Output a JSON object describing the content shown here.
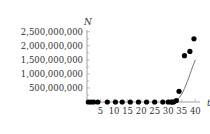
{
  "chart_data": {
    "type": "scatter",
    "title": "",
    "xlabel": "t",
    "ylabel": "N",
    "xlim": [
      0,
      41
    ],
    "ylim": [
      0,
      2600000000
    ],
    "grid": false,
    "legend": "none",
    "x_ticks": [
      5,
      10,
      15,
      20,
      25,
      30,
      35,
      40
    ],
    "x_tick_labels": [
      "5",
      "10",
      "15",
      "20",
      "25",
      "30",
      "35",
      "40"
    ],
    "y_ticks": [
      500000000,
      1000000000,
      1500000000,
      2000000000,
      2500000000
    ],
    "y_tick_labels": [
      "500,000,000",
      "1,000,000,000",
      "1,500,000,000",
      "2,000,000,000",
      "2,500,000,000"
    ],
    "series": [
      {
        "name": "observed",
        "kind": "points",
        "color": "#000000",
        "x": [
          0.5,
          1.5,
          2.5,
          4,
          7.5,
          10.5,
          13,
          16,
          19,
          22,
          25,
          28,
          30,
          31,
          31.5,
          32,
          33,
          34,
          36,
          38,
          39.5
        ],
        "y": [
          0,
          0,
          0,
          0,
          0,
          0,
          0,
          0,
          0,
          0,
          0,
          0,
          0,
          0,
          0,
          0,
          50000000,
          380000000,
          1650000000,
          1800000000,
          2250000000
        ]
      },
      {
        "name": "model",
        "kind": "line",
        "color": "#777777",
        "x": [
          30,
          31,
          32,
          33,
          34,
          35,
          36,
          37,
          38,
          39,
          40
        ],
        "y": [
          0,
          5000000,
          20000000,
          60000000,
          140000000,
          280000000,
          480000000,
          720000000,
          980000000,
          1250000000,
          1500000000
        ]
      }
    ]
  }
}
